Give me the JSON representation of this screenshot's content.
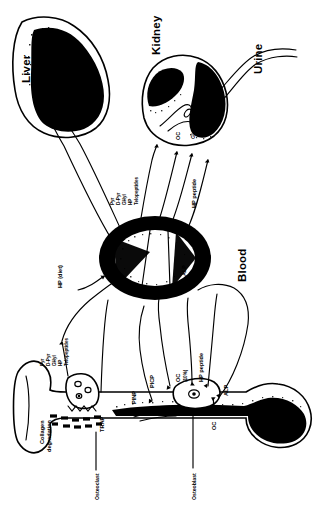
{
  "figure": {
    "title_alt": "Bone turnover marker metabolism: bone, blood, liver, kidney, urine",
    "orientation_note": "Diagram rendered rotated 90 degrees (text reads bottom-to-top)",
    "colors": {
      "ink": "#000000",
      "paper": "#ffffff"
    }
  },
  "compartments": [
    {
      "id": "liver",
      "label": "Liver"
    },
    {
      "id": "kidney",
      "label": "Kidney"
    },
    {
      "id": "urine",
      "label": "Urine"
    },
    {
      "id": "blood",
      "label": "Blood"
    }
  ],
  "liver_markers": [
    {
      "id": "free-hp",
      "label": "Free HP"
    },
    {
      "id": "picp",
      "label": "PICP"
    }
  ],
  "kidney_markers": [
    {
      "id": "oc",
      "label": "OC"
    },
    {
      "id": "gla",
      "label": "Gla"
    }
  ],
  "blood_markers": [
    {
      "id": "trap",
      "label": "TRAP"
    },
    {
      "id": "alp",
      "label": "ALP"
    }
  ],
  "blood_to_kidney_fluxes": [
    {
      "id": "degradation-products",
      "label": "Pyr\nD-Pyr\nGHyl\nHP\nTelopeptides",
      "lines": [
        "Pyr",
        "D-Pyr",
        "GHyl",
        "HP",
        "Telopeptides"
      ]
    },
    {
      "id": "hp-peptide",
      "label": "HP peptide"
    }
  ],
  "diet_input": {
    "id": "hp-diet",
    "label": "HP (diet)"
  },
  "bone": {
    "resorption": {
      "process_label": "Collagen\ndegradation",
      "process_lines": [
        "Collagen",
        "degradation"
      ],
      "cell_label": "Osteoclast",
      "enzyme_label": "TRAP",
      "products": {
        "id": "resorption-products",
        "lines": [
          "Pyr",
          "D-Pyr",
          "GHyl",
          "HP",
          "Telopeptides"
        ]
      }
    },
    "formation": {
      "cell_label": "Osteoblast",
      "products": [
        {
          "id": "pinp",
          "label": "PINP"
        },
        {
          "id": "picp",
          "label": "PICP"
        },
        {
          "id": "oc-10",
          "label": "OC\n(10%)",
          "lines": [
            "OC",
            "(10%)"
          ]
        },
        {
          "id": "hp-peptide",
          "label": "HP peptide"
        },
        {
          "id": "alp",
          "label": "ALP"
        },
        {
          "id": "oc-bone",
          "label": "OC"
        }
      ]
    }
  },
  "legend_keys": {
    "pyr": "Pyr",
    "d_pyr": "D-Pyr",
    "ghyl": "GHyl",
    "hp": "HP",
    "telopeptides": "Telopeptides",
    "hp_peptide": "HP peptide",
    "picp": "PICP",
    "pinp": "PINP",
    "alp": "ALP",
    "trap": "TRAP",
    "oc": "OC",
    "gla": "Gla",
    "free_hp": "Free HP",
    "oc_10": "OC (10%)"
  }
}
